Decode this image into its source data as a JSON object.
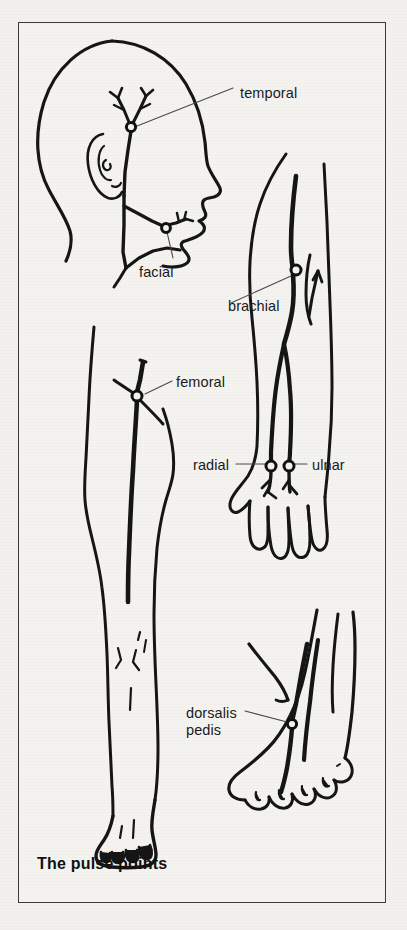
{
  "figure": {
    "caption": "The pulse points",
    "frame_color": "#3a3a3a",
    "background_color": "#f4f3f0",
    "ink_color": "#1b1b1b"
  },
  "diagram": {
    "type": "anatomical-line-drawing",
    "views": [
      {
        "name": "head-profile",
        "description": "side view of head and neck showing temporal and facial arteries"
      },
      {
        "name": "arm",
        "description": "right arm with brachial, radial and ulnar arteries and hand"
      },
      {
        "name": "leg",
        "description": "leg showing femoral artery down to the foot"
      },
      {
        "name": "foot",
        "description": "dorsum of foot showing dorsalis pedis artery"
      }
    ]
  },
  "labels": [
    {
      "id": "temporal",
      "text": "temporal",
      "x": 240,
      "y": 85,
      "align": "left"
    },
    {
      "id": "facial",
      "text": "facial",
      "x": 139,
      "y": 264,
      "align": "left"
    },
    {
      "id": "brachial",
      "text": "brachial",
      "x": 228,
      "y": 298,
      "align": "left"
    },
    {
      "id": "femoral",
      "text": "femoral",
      "x": 176,
      "y": 374,
      "align": "left"
    },
    {
      "id": "radial",
      "text": "radial",
      "x": 193,
      "y": 457,
      "align": "left"
    },
    {
      "id": "ulnar",
      "text": "ulnar",
      "x": 312,
      "y": 457,
      "align": "left"
    },
    {
      "id": "dorsalis-pedis",
      "text": "dorsalis\npedis",
      "x": 186,
      "y": 705,
      "align": "left"
    }
  ],
  "pulse_points": [
    {
      "id": "temporal",
      "marker_x": 131,
      "marker_y": 127
    },
    {
      "id": "facial",
      "marker_x": 166,
      "marker_y": 228
    },
    {
      "id": "brachial",
      "marker_x": 296,
      "marker_y": 270
    },
    {
      "id": "femoral",
      "marker_x": 137,
      "marker_y": 396
    },
    {
      "id": "radial",
      "marker_x": 271,
      "marker_y": 466
    },
    {
      "id": "ulnar",
      "marker_x": 289,
      "marker_y": 466
    },
    {
      "id": "dorsalis-pedis",
      "marker_x": 292,
      "marker_y": 724
    }
  ]
}
